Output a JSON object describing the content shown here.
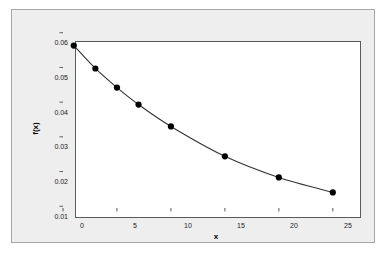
{
  "chart_data": {
    "type": "line",
    "title": "",
    "subtitle": "",
    "xlabel": "x",
    "ylabel": "f(x)",
    "x": [
      1,
      3,
      5,
      7,
      10,
      15,
      20,
      25
    ],
    "values": [
      0.0563,
      0.0497,
      0.0442,
      0.0393,
      0.033,
      0.0244,
      0.0183,
      0.014
    ],
    "series": [
      {
        "name": "f(x)",
        "x": [
          1,
          3,
          5,
          7,
          10,
          15,
          20,
          25
        ],
        "values": [
          0.0563,
          0.0497,
          0.0442,
          0.0393,
          0.033,
          0.0244,
          0.0183,
          0.014
        ]
      }
    ],
    "xlim": [
      0,
      26.5
    ],
    "ylim": [
      0.0095,
      0.0605
    ],
    "xticks": [
      0,
      5,
      10,
      15,
      20,
      25
    ],
    "yticks": [
      0.01,
      0.02,
      0.03,
      0.04,
      0.05,
      0.06
    ],
    "xtick_labels": [
      "0",
      "5",
      "10",
      "15",
      "20",
      "25"
    ],
    "ytick_labels": [
      "0.01",
      "0.02",
      "0.03",
      "0.04",
      "0.05",
      "0.06"
    ],
    "grid": false,
    "legend": false,
    "legend_position": "none",
    "marker": "filled-circle",
    "marker_color": "#000000",
    "line_color": "#333333",
    "panel_background": "#eeeeee",
    "plot_background": "#ffffff",
    "frame_color": "#5a5a5a",
    "annotations": []
  }
}
